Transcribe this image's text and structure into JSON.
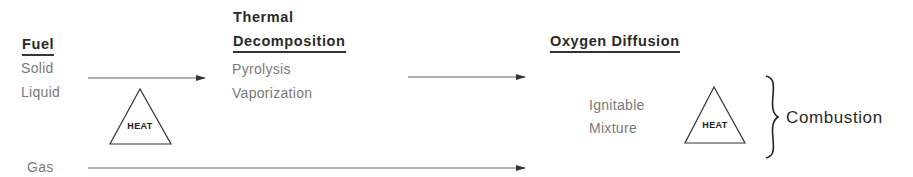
{
  "diagram": {
    "stages": {
      "fuel": {
        "title": "Fuel",
        "items": [
          "Solid",
          "Liquid"
        ],
        "gas": "Gas"
      },
      "thermal_decomposition": {
        "title_line1": "Thermal",
        "title_line2": "Decomposition",
        "items": [
          "Pyrolysis",
          "Vaporization"
        ]
      },
      "oxygen_diffusion": {
        "title": "Oxygen Diffusion",
        "items": [
          "Ignitable",
          "Mixture"
        ]
      }
    },
    "heat_label_1": "HEAT",
    "heat_label_2": "HEAT",
    "result": "Combustion",
    "colors": {
      "ink": "#2a2a2a",
      "light_text": "#7a7a7a",
      "line": "#555555"
    }
  }
}
